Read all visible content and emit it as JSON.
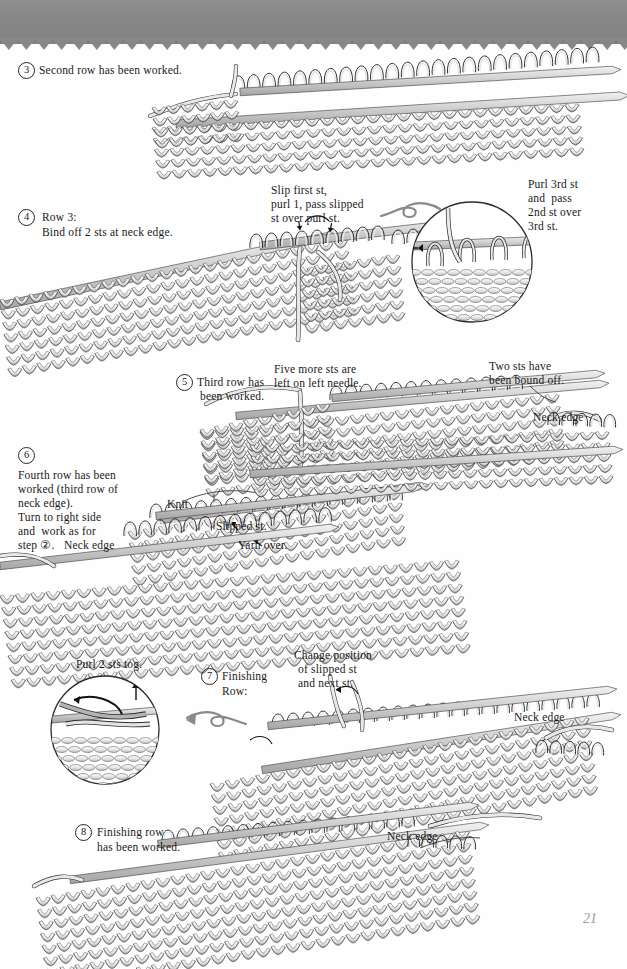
{
  "page": {
    "number": "21",
    "band_color": "#878787",
    "bg_color": "#fefefe",
    "ink_color": "#1a1a1a",
    "yarn_light": "#e9e9e9",
    "yarn_shade": "#b9b9b9",
    "needle_color": "#c9c9c9"
  },
  "steps": [
    {
      "id": "step-3",
      "marker": "3",
      "text": "Second row has been worked."
    },
    {
      "id": "step-4",
      "marker": "4",
      "line1": "Row 3:",
      "line2": "Bind off 2 sts at neck edge."
    },
    {
      "id": "step-5",
      "marker": "5",
      "line1": "Third row has",
      "line2": "been worked."
    },
    {
      "id": "step-6",
      "marker": "6",
      "line1": "Fourth row has been",
      "line2": "worked (third row of",
      "line3": "neck edge).",
      "line4": "Turn to right side",
      "line5": "and  work as for",
      "line6": "step ②.   Neck edge"
    },
    {
      "id": "step-7",
      "marker": "7",
      "line1": "Finishing",
      "line2": "Row:"
    },
    {
      "id": "step-8",
      "marker": "8",
      "line1": "Finishing row",
      "line2": "has been worked."
    }
  ],
  "annotations": {
    "slip_first": {
      "line1": "Slip first st,",
      "line2": "purl 1, pass slipped",
      "line3": "st over purl st."
    },
    "purl_3rd": {
      "line1": "Purl 3rd st",
      "line2": "and  pass",
      "line3": "2nd st over",
      "line4": "3rd st."
    },
    "five_more": {
      "line1": "Five more sts are",
      "line2": "left on left needle."
    },
    "two_bound": {
      "line1": "Two sts have",
      "line2": "been bound off."
    },
    "knit": "Knit",
    "slipped_st": "Slipped st.",
    "yarn_over": "Yarn over.",
    "purl_2_tog": "Purl 2 sts tog.",
    "change_position": {
      "line1": "Change position",
      "line2": "of slipped st",
      "line3": "and next st."
    },
    "neck_edge_1": "Neck edge",
    "neck_edge_2": "Neck edge",
    "neck_edge_3": "Neck edge"
  }
}
